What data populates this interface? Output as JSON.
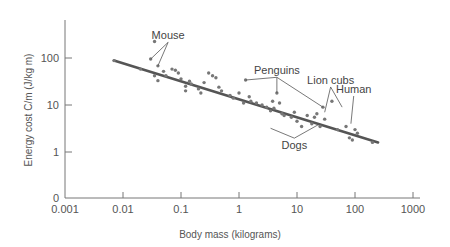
{
  "chart_data": {
    "type": "scatter",
    "title": "",
    "xlabel": "Body mass (kilograms)",
    "ylabel": "Energy cost C/m (J/kg m)",
    "xscale": "log",
    "yscale": "log",
    "xlim": [
      0.001,
      1000
    ],
    "ylim": [
      0.1,
      1000
    ],
    "grid": false,
    "legend": "none",
    "x_ticks": [
      {
        "value": 0.001,
        "label": "0.001"
      },
      {
        "value": 0.01,
        "label": "0.01"
      },
      {
        "value": 0.1,
        "label": "0.1"
      },
      {
        "value": 1,
        "label": "1"
      },
      {
        "value": 10,
        "label": "10"
      },
      {
        "value": 100,
        "label": "100"
      },
      {
        "value": 1000,
        "label": "1000"
      }
    ],
    "y_ticks": [
      {
        "value": 0.1,
        "label": "0"
      },
      {
        "value": 1,
        "label": "1"
      },
      {
        "value": 10,
        "label": "10"
      },
      {
        "value": 100,
        "label": "100"
      }
    ],
    "fit_line": {
      "x": [
        0.007,
        250
      ],
      "y": [
        88,
        1.6
      ]
    },
    "series": [
      {
        "name": "Species measurements",
        "points": [
          [
            0.007,
            88
          ],
          [
            0.02,
            58
          ],
          [
            0.03,
            95
          ],
          [
            0.035,
            225
          ],
          [
            0.035,
            42
          ],
          [
            0.04,
            68
          ],
          [
            0.04,
            33
          ],
          [
            0.05,
            52
          ],
          [
            0.055,
            42
          ],
          [
            0.07,
            58
          ],
          [
            0.08,
            55
          ],
          [
            0.09,
            48
          ],
          [
            0.1,
            36
          ],
          [
            0.12,
            25
          ],
          [
            0.12,
            20
          ],
          [
            0.14,
            32
          ],
          [
            0.15,
            28
          ],
          [
            0.2,
            22
          ],
          [
            0.22,
            18
          ],
          [
            0.25,
            30
          ],
          [
            0.3,
            48
          ],
          [
            0.35,
            42
          ],
          [
            0.4,
            38
          ],
          [
            0.45,
            24
          ],
          [
            0.5,
            20
          ],
          [
            0.7,
            16
          ],
          [
            0.8,
            14
          ],
          [
            1.0,
            18
          ],
          [
            1.2,
            11
          ],
          [
            1.3,
            34
          ],
          [
            1.5,
            15
          ],
          [
            1.6,
            12
          ],
          [
            2.0,
            11
          ],
          [
            2.5,
            10
          ],
          [
            3.0,
            9
          ],
          [
            3.5,
            7.5
          ],
          [
            3.8,
            12
          ],
          [
            4.0,
            8.5
          ],
          [
            4.5,
            18
          ],
          [
            5.0,
            11
          ],
          [
            5.5,
            6.5
          ],
          [
            6.0,
            6
          ],
          [
            8.0,
            5.5
          ],
          [
            9.0,
            7
          ],
          [
            10,
            4.5
          ],
          [
            12,
            3.5
          ],
          [
            15,
            6
          ],
          [
            18,
            4
          ],
          [
            20,
            5.5
          ],
          [
            22,
            6.5
          ],
          [
            25,
            3.5
          ],
          [
            28,
            9
          ],
          [
            30,
            5
          ],
          [
            40,
            12
          ],
          [
            50,
            3
          ],
          [
            70,
            3.5
          ],
          [
            80,
            2
          ],
          [
            90,
            1.8
          ],
          [
            100,
            3
          ],
          [
            110,
            2.5
          ],
          [
            200,
            1.6
          ]
        ]
      }
    ],
    "annotations": [
      {
        "label": "Mouse",
        "text_x": 0.06,
        "text_y": 250,
        "targets": [
          [
            0.03,
            95
          ],
          [
            0.04,
            68
          ]
        ]
      },
      {
        "label": "Penguins",
        "text_x": 4.5,
        "text_y": 45,
        "targets": [
          [
            1.3,
            34
          ],
          [
            4.5,
            18
          ],
          [
            28,
            9
          ]
        ]
      },
      {
        "label": "Lion cubs",
        "text_x": 38,
        "text_y": 28,
        "targets": [
          [
            30,
            7
          ],
          [
            60,
            9
          ]
        ]
      },
      {
        "label": "Human",
        "text_x": 95,
        "text_y": 18,
        "targets": [
          [
            85,
            4
          ]
        ]
      },
      {
        "label": "Dogs",
        "text_x": 9,
        "text_y": 1.15,
        "targets": [
          [
            3.5,
            3.2
          ],
          [
            25,
            4
          ]
        ]
      }
    ]
  },
  "plot_area": {
    "x0": 65,
    "y_axis_top": 20,
    "x_axis_y": 198,
    "px_per_decade_x": 58,
    "px_per_decade_y": 47,
    "y_at_1": 152,
    "x_end": 420
  },
  "colors": {
    "axis": "#777777",
    "line": "#555555",
    "point": "#777777",
    "text": "#555555"
  }
}
